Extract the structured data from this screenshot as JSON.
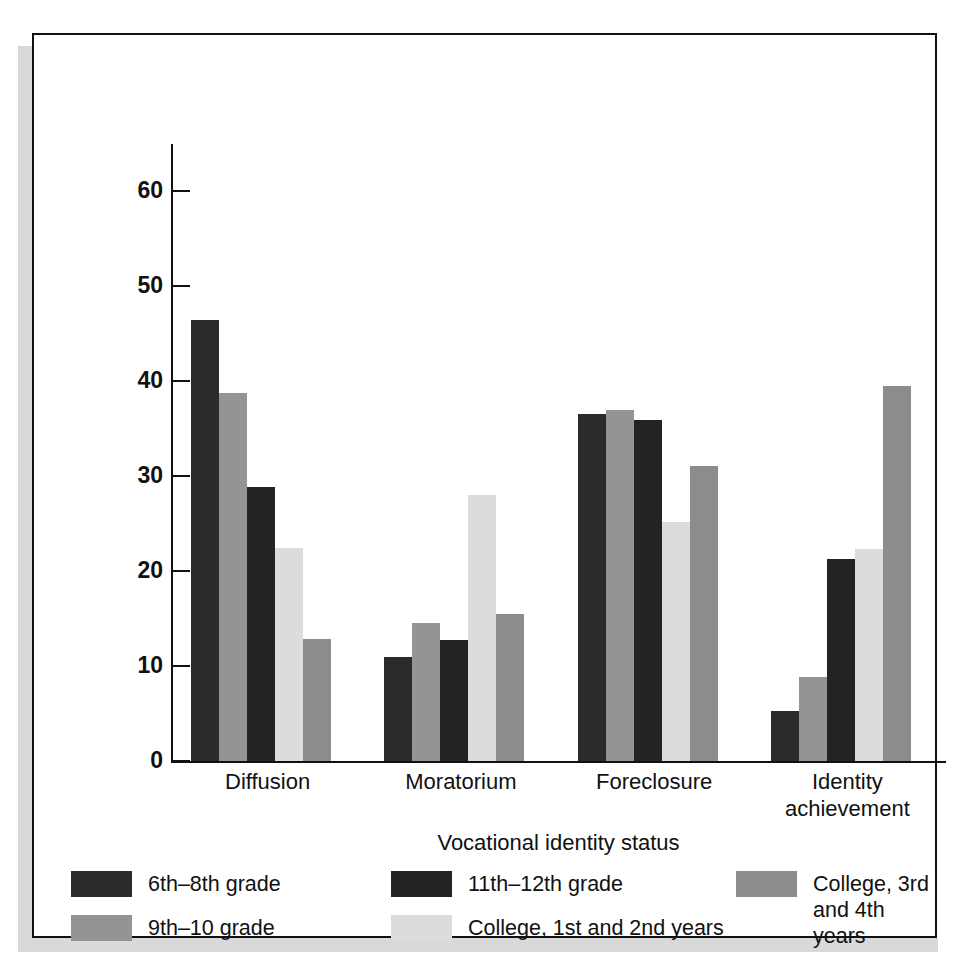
{
  "chart_data": {
    "type": "bar",
    "title": "",
    "xlabel": "Vocational identity status",
    "ylabel": "Percentage of young people in each status for vocational choice",
    "categories": [
      "Diffusion",
      "Moratorium",
      "Foreclosure",
      "Identity\nachievement"
    ],
    "yticks": [
      0,
      10,
      20,
      30,
      40,
      50,
      60
    ],
    "ylim": [
      0,
      65
    ],
    "grid": false,
    "legend_position": "below-axes",
    "series": [
      {
        "name": "6th–8th grade",
        "color": "#2b2b2b",
        "values": [
          46.5,
          11.0,
          36.6,
          5.3
        ]
      },
      {
        "name": "9th–10 grade",
        "color": "#949494",
        "values": [
          38.8,
          14.5,
          37.0,
          8.9
        ]
      },
      {
        "name": "11th–12th grade",
        "color": "#232323",
        "values": [
          28.9,
          12.8,
          35.9,
          21.3
        ]
      },
      {
        "name": "College, 1st and 2nd years",
        "color": "#dcdcdc",
        "values": [
          22.4,
          28.0,
          25.2,
          22.3
        ]
      },
      {
        "name": "College, 3rd\nand 4th years",
        "color": "#8c8c8c",
        "values": [
          12.9,
          15.5,
          31.1,
          39.5
        ]
      }
    ]
  },
  "axis": {
    "y_title": "Percentage of young people in each status for vocational choice",
    "x_title": "Vocational identity status",
    "tick_0": "0",
    "tick_10": "10",
    "tick_20": "20",
    "tick_30": "30",
    "tick_40": "40",
    "tick_50": "50",
    "tick_60": "60"
  },
  "categories": {
    "c0": "Diffusion",
    "c1": "Moratorium",
    "c2": "Foreclosure",
    "c3_line1": "Identity",
    "c3_line2": "achievement"
  },
  "legend": {
    "item0": "6th–8th grade",
    "item1": "9th–10 grade",
    "item2": "11th–12th grade",
    "item3": "College, 1st and 2nd years",
    "item4_line1": "College, 3rd",
    "item4_line2": "and 4th years"
  }
}
